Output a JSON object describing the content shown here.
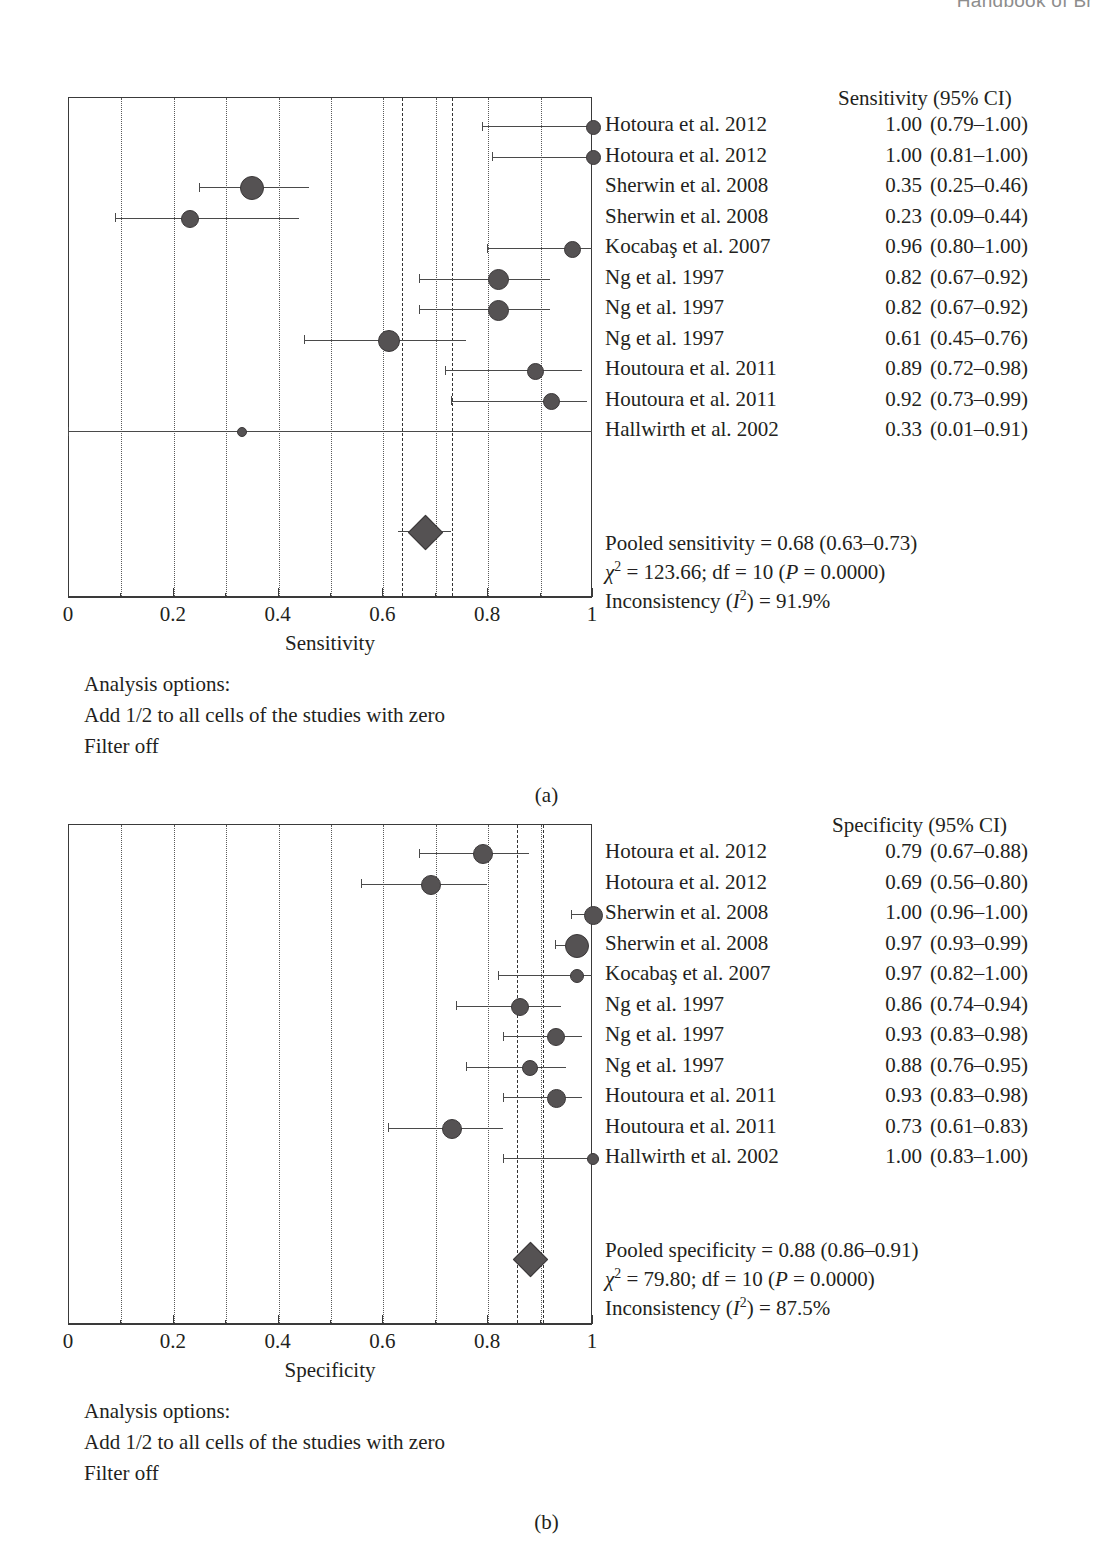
{
  "running_header": "Handbook of Br",
  "panels": [
    {
      "letter": "(a)",
      "column_header": "Sensitivity (95% CI)",
      "axis_title": "Sensitivity",
      "tick_labels": [
        "0",
        "0.2",
        "0.4",
        "0.6",
        "0.8",
        "1"
      ],
      "pooled_text_prefix": "Pooled sensitivity = ",
      "pooled_text_value": "0.68 (0.63–0.73)",
      "chi_label": "χ",
      "chi_sup": "2",
      "chi_text": " = 123.66; df = 10 (",
      "p_italic": "P",
      "p_text": " = 0.0000)",
      "incon_label": "Inconsistency (",
      "incon_italic": "I",
      "incon_sup": "2",
      "incon_text": ") = 91.9%",
      "options_title": "Analysis options:",
      "options_line1": "Add 1/2 to all cells of the studies with zero",
      "options_line2": "Filter off",
      "rows": [
        {
          "study": "Hotoura et al. 2012",
          "est": "1.00",
          "ci": "(0.79–1.00)",
          "value": 1.0,
          "low": 0.79,
          "high": 1.0,
          "size": 13
        },
        {
          "study": "Hotoura et al. 2012",
          "est": "1.00",
          "ci": "(0.81–1.00)",
          "value": 1.0,
          "low": 0.81,
          "high": 1.0,
          "size": 13
        },
        {
          "study": "Sherwin et al. 2008",
          "est": "0.35",
          "ci": "(0.25–0.46)",
          "value": 0.35,
          "low": 0.25,
          "high": 0.46,
          "size": 22
        },
        {
          "study": "Sherwin et al. 2008",
          "est": "0.23",
          "ci": "(0.09–0.44)",
          "value": 0.23,
          "low": 0.09,
          "high": 0.44,
          "size": 16
        },
        {
          "study": "Kocabaş et al. 2007",
          "est": "0.96",
          "ci": "(0.80–1.00)",
          "value": 0.96,
          "low": 0.8,
          "high": 1.0,
          "size": 15
        },
        {
          "study": "Ng et al. 1997",
          "est": "0.82",
          "ci": "(0.67–0.92)",
          "value": 0.82,
          "low": 0.67,
          "high": 0.92,
          "size": 19
        },
        {
          "study": "Ng et al. 1997",
          "est": "0.82",
          "ci": "(0.67–0.92)",
          "value": 0.82,
          "low": 0.67,
          "high": 0.92,
          "size": 19
        },
        {
          "study": "Ng et al. 1997",
          "est": "0.61",
          "ci": "(0.45–0.76)",
          "value": 0.61,
          "low": 0.45,
          "high": 0.76,
          "size": 20
        },
        {
          "study": "Houtoura et al. 2011",
          "est": "0.89",
          "ci": "(0.72–0.98)",
          "value": 0.89,
          "low": 0.72,
          "high": 0.98,
          "size": 15
        },
        {
          "study": "Houtoura et al. 2011",
          "est": "0.92",
          "ci": "(0.73–0.99)",
          "value": 0.92,
          "low": 0.73,
          "high": 0.99,
          "size": 15
        },
        {
          "study": "Hallwirth et al. 2002",
          "est": "0.33",
          "ci": "(0.01–0.91)",
          "value": 0.33,
          "low": 0.0,
          "high": 1.0,
          "size": 8
        }
      ],
      "pooled": {
        "value": 0.68,
        "low": 0.63,
        "high": 0.73
      },
      "reflines": [
        0.635,
        0.73
      ]
    },
    {
      "letter": "(b)",
      "column_header": "Specificity (95% CI)",
      "axis_title": "Specificity",
      "tick_labels": [
        "0",
        "0.2",
        "0.4",
        "0.6",
        "0.8",
        "1"
      ],
      "pooled_text_prefix": "Pooled specificity = ",
      "pooled_text_value": "0.88 (0.86–0.91)",
      "chi_label": "χ",
      "chi_sup": "2",
      "chi_text": " = 79.80; df = 10 (",
      "p_italic": "P",
      "p_text": " = 0.0000)",
      "incon_label": "Inconsistency (",
      "incon_italic": "I",
      "incon_sup": "2",
      "incon_text": ") = 87.5%",
      "options_title": "Analysis options:",
      "options_line1": "Add 1/2 to all cells of the studies with zero",
      "options_line2": "Filter off",
      "rows": [
        {
          "study": "Hotoura et al. 2012",
          "est": "0.79",
          "ci": "(0.67–0.88)",
          "value": 0.79,
          "low": 0.67,
          "high": 0.88,
          "size": 18
        },
        {
          "study": "Hotoura et al. 2012",
          "est": "0.69",
          "ci": "(0.56–0.80)",
          "value": 0.69,
          "low": 0.56,
          "high": 0.8,
          "size": 18
        },
        {
          "study": "Sherwin et al. 2008",
          "est": "1.00",
          "ci": "(0.96–1.00)",
          "value": 1.0,
          "low": 0.96,
          "high": 1.0,
          "size": 17
        },
        {
          "study": "Sherwin et al. 2008",
          "est": "0.97",
          "ci": "(0.93–0.99)",
          "value": 0.97,
          "low": 0.93,
          "high": 0.99,
          "size": 22
        },
        {
          "study": "Kocabaş et al. 2007",
          "est": "0.97",
          "ci": "(0.82–1.00)",
          "value": 0.97,
          "low": 0.82,
          "high": 1.0,
          "size": 12
        },
        {
          "study": "Ng et al. 1997",
          "est": "0.86",
          "ci": "(0.74–0.94)",
          "value": 0.86,
          "low": 0.74,
          "high": 0.94,
          "size": 16
        },
        {
          "study": "Ng et al. 1997",
          "est": "0.93",
          "ci": "(0.83–0.98)",
          "value": 0.93,
          "low": 0.83,
          "high": 0.98,
          "size": 16
        },
        {
          "study": "Ng et al. 1997",
          "est": "0.88",
          "ci": "(0.76–0.95)",
          "value": 0.88,
          "low": 0.76,
          "high": 0.95,
          "size": 14
        },
        {
          "study": "Houtoura et al. 2011",
          "est": "0.93",
          "ci": "(0.83–0.98)",
          "value": 0.93,
          "low": 0.83,
          "high": 0.98,
          "size": 17
        },
        {
          "study": "Houtoura et al. 2011",
          "est": "0.73",
          "ci": "(0.61–0.83)",
          "value": 0.73,
          "low": 0.61,
          "high": 0.83,
          "size": 18
        },
        {
          "study": "Hallwirth et al. 2002",
          "est": "1.00",
          "ci": "(0.83–1.00)",
          "value": 1.0,
          "low": 0.83,
          "high": 1.0,
          "size": 10
        }
      ],
      "pooled": {
        "value": 0.88,
        "low": 0.855,
        "high": 0.905
      },
      "reflines": [
        0.855,
        0.905
      ]
    }
  ],
  "chart_data": {
    "type": "scatter",
    "subcharts": [
      {
        "type": "scatter",
        "title": "(a) Sensitivity forest plot",
        "xlabel": "Sensitivity",
        "xlim": [
          0,
          1
        ],
        "xticks": [
          0,
          0.2,
          0.4,
          0.6,
          0.8,
          1
        ],
        "grid": "vertical dotted at 0.1 intervals",
        "legend": "none",
        "categories": [
          "Hotoura et al. 2012",
          "Hotoura et al. 2012",
          "Sherwin et al. 2008",
          "Sherwin et al. 2008",
          "Kocabaş et al. 2007",
          "Ng et al. 1997",
          "Ng et al. 1997",
          "Ng et al. 1997",
          "Houtoura et al. 2011",
          "Houtoura et al. 2011",
          "Hallwirth et al. 2002"
        ],
        "values": [
          1.0,
          1.0,
          0.35,
          0.23,
          0.96,
          0.82,
          0.82,
          0.61,
          0.89,
          0.92,
          0.33
        ],
        "ci_low": [
          0.79,
          0.81,
          0.25,
          0.09,
          0.8,
          0.67,
          0.67,
          0.45,
          0.72,
          0.73,
          0.01
        ],
        "ci_high": [
          1.0,
          1.0,
          0.46,
          0.44,
          1.0,
          0.92,
          0.92,
          0.76,
          0.98,
          0.99,
          0.91
        ],
        "pooled": {
          "value": 0.68,
          "ci_low": 0.63,
          "ci_high": 0.73
        },
        "heterogeneity": {
          "chi2": 123.66,
          "df": 10,
          "p": 0.0,
          "I2_percent": 91.9
        }
      },
      {
        "type": "scatter",
        "title": "(b) Specificity forest plot",
        "xlabel": "Specificity",
        "xlim": [
          0,
          1
        ],
        "xticks": [
          0,
          0.2,
          0.4,
          0.6,
          0.8,
          1
        ],
        "grid": "vertical dotted at 0.1 intervals",
        "legend": "none",
        "categories": [
          "Hotoura et al. 2012",
          "Hotoura et al. 2012",
          "Sherwin et al. 2008",
          "Sherwin et al. 2008",
          "Kocabaş et al. 2007",
          "Ng et al. 1997",
          "Ng et al. 1997",
          "Ng et al. 1997",
          "Houtoura et al. 2011",
          "Houtoura et al. 2011",
          "Hallwirth et al. 2002"
        ],
        "values": [
          0.79,
          0.69,
          1.0,
          0.97,
          0.97,
          0.86,
          0.93,
          0.88,
          0.93,
          0.73,
          1.0
        ],
        "ci_low": [
          0.67,
          0.56,
          0.96,
          0.93,
          0.82,
          0.74,
          0.83,
          0.76,
          0.83,
          0.61,
          0.83
        ],
        "ci_high": [
          0.88,
          0.8,
          1.0,
          0.99,
          1.0,
          0.94,
          0.98,
          0.95,
          0.98,
          0.83,
          1.0
        ],
        "pooled": {
          "value": 0.88,
          "ci_low": 0.86,
          "ci_high": 0.91
        },
        "heterogeneity": {
          "chi2": 79.8,
          "df": 10,
          "p": 0.0,
          "I2_percent": 87.5
        }
      }
    ]
  }
}
